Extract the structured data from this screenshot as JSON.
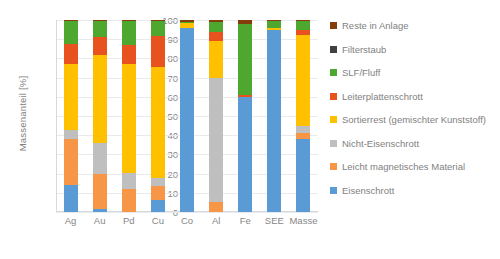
{
  "chart_data": {
    "type": "bar",
    "subtype": "stacked-bar-100-percent",
    "title": "",
    "xlabel": "",
    "ylabel": "Massenanteil [%]",
    "ylim": [
      0,
      100
    ],
    "yticks": [
      0,
      10,
      20,
      30,
      40,
      50,
      60,
      70,
      80,
      90,
      100
    ],
    "grid": true,
    "legend_position": "right",
    "categories": [
      "Ag",
      "Au",
      "Pd",
      "Cu",
      "Co",
      "Al",
      "Fe",
      "SEE",
      "Masse"
    ],
    "series": [
      {
        "name": "Eisenschrott",
        "color": "#5b9bd5",
        "values": [
          14.0,
          1.5,
          0.0,
          6.5,
          96.0,
          0.0,
          60.0,
          95.0,
          38.0
        ]
      },
      {
        "name": "Leicht magnetisches Material",
        "color": "#f79646",
        "values": [
          24.0,
          18.5,
          12.0,
          7.0,
          0.0,
          5.0,
          0.0,
          0.0,
          3.0
        ]
      },
      {
        "name": "Nicht-Eisenschrott",
        "color": "#bfbfbf",
        "values": [
          4.5,
          16.0,
          8.5,
          4.0,
          0.0,
          65.0,
          0.0,
          0.0,
          4.0
        ]
      },
      {
        "name": "Sortierrest (gemischter Kunststoff)",
        "color": "#ffc000",
        "values": [
          34.5,
          46.0,
          56.5,
          58.0,
          2.5,
          19.0,
          0.0,
          1.0,
          47.0
        ]
      },
      {
        "name": "Leiterplattenschrott",
        "color": "#e8521f",
        "values": [
          10.5,
          9.0,
          10.0,
          16.0,
          0.0,
          5.0,
          1.0,
          0.0,
          3.0
        ]
      },
      {
        "name": "SLF/Fluff",
        "color": "#4ea72e",
        "values": [
          12.0,
          8.5,
          12.5,
          8.0,
          0.5,
          5.0,
          37.0,
          3.5,
          4.5
        ]
      },
      {
        "name": "Filterstaub",
        "color": "#404040",
        "values": [
          0.0,
          0.0,
          0.0,
          0.0,
          0.0,
          0.0,
          0.0,
          0.0,
          0.0
        ]
      },
      {
        "name": "Reste in Anlage",
        "color": "#843c0b",
        "values": [
          0.5,
          0.5,
          0.5,
          0.5,
          1.0,
          1.0,
          2.0,
          0.5,
          0.5
        ]
      }
    ]
  },
  "legend": {
    "items": [
      {
        "label": "Reste in Anlage",
        "color": "#843c0b"
      },
      {
        "label": "Filterstaub",
        "color": "#404040"
      },
      {
        "label": "SLF/Fluff",
        "color": "#4ea72e"
      },
      {
        "label": "Leiterplattenschrott",
        "color": "#e8521f"
      },
      {
        "label": "Sortierrest (gemischter Kunststoff)",
        "color": "#ffc000"
      },
      {
        "label": "Nicht-Eisenschrott",
        "color": "#bfbfbf"
      },
      {
        "label": "Leicht magnetisches Material",
        "color": "#f79646"
      },
      {
        "label": "Eisenschrott",
        "color": "#5b9bd5"
      }
    ]
  }
}
